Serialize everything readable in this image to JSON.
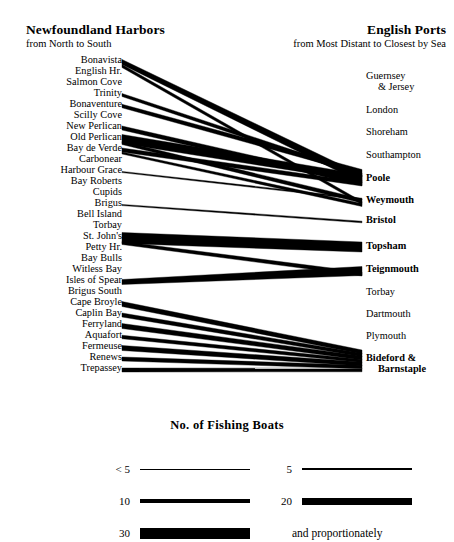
{
  "figure": {
    "left_header": {
      "title": "Newfoundland Harbors",
      "subtitle": "from North to South"
    },
    "right_header": {
      "title": "English Ports",
      "subtitle": "from Most Distant to Closest by Sea"
    }
  },
  "left_labels": [
    {
      "name": "Bonavista",
      "y": 62
    },
    {
      "name": "English Hr.",
      "y": 73
    },
    {
      "name": "Salmon Cove",
      "y": 84
    },
    {
      "name": "Trinity",
      "y": 95
    },
    {
      "name": "Bonaventure",
      "y": 106
    },
    {
      "name": "Scilly Cove",
      "y": 117
    },
    {
      "name": "New Perlican",
      "y": 128
    },
    {
      "name": "Old Perlican",
      "y": 139
    },
    {
      "name": "Bay de Verde",
      "y": 150
    },
    {
      "name": "Carbonear",
      "y": 161
    },
    {
      "name": "Harbour Grace",
      "y": 172
    },
    {
      "name": "Bay Roberts",
      "y": 183
    },
    {
      "name": "Cupids",
      "y": 194
    },
    {
      "name": "Brigus",
      "y": 205
    },
    {
      "name": "Bell Island",
      "y": 216
    },
    {
      "name": "Torbay",
      "y": 227
    },
    {
      "name": "St. John's",
      "y": 238
    },
    {
      "name": "Petty Hr.",
      "y": 249
    },
    {
      "name": "Bay Bulls",
      "y": 260
    },
    {
      "name": "Witless Bay",
      "y": 271
    },
    {
      "name": "Isles of Spear",
      "y": 282
    },
    {
      "name": "Brigus South",
      "y": 293
    },
    {
      "name": "Cape Broyle",
      "y": 304
    },
    {
      "name": "Caplin Bay",
      "y": 315
    },
    {
      "name": "Ferryland",
      "y": 326
    },
    {
      "name": "Aquafort",
      "y": 337
    },
    {
      "name": "Fermeuse",
      "y": 348
    },
    {
      "name": "Renews",
      "y": 359
    },
    {
      "name": "Trepassey",
      "y": 370
    }
  ],
  "right_labels": [
    {
      "name": "Guernsey",
      "line2": "& Jersey",
      "y": 78,
      "bold": false
    },
    {
      "name": "London",
      "line2": "",
      "y": 112,
      "bold": false
    },
    {
      "name": "Shoreham",
      "line2": "",
      "y": 134,
      "bold": false
    },
    {
      "name": "Southampton",
      "line2": "",
      "y": 157,
      "bold": false
    },
    {
      "name": "Poole",
      "line2": "",
      "y": 180,
      "bold": true
    },
    {
      "name": "Weymouth",
      "line2": "",
      "y": 202,
      "bold": true
    },
    {
      "name": "Bristol",
      "line2": "",
      "y": 222,
      "bold": true
    },
    {
      "name": "Topsham",
      "line2": "",
      "y": 248,
      "bold": true
    },
    {
      "name": "Teignmouth",
      "line2": "",
      "y": 271,
      "bold": true
    },
    {
      "name": "Torbay",
      "line2": "",
      "y": 294,
      "bold": false
    },
    {
      "name": "Dartmouth",
      "line2": "",
      "y": 316,
      "bold": false
    },
    {
      "name": "Plymouth",
      "line2": "",
      "y": 338,
      "bold": false
    },
    {
      "name": "Bideford &",
      "line2": "Barnstaple",
      "y": 360,
      "bold": true
    }
  ],
  "legend": {
    "title": "No.  of  Fishing Boats",
    "items": [
      {
        "key": "< 5",
        "thickness": 1,
        "col": 0,
        "row": 0
      },
      {
        "key": "5",
        "thickness": 2,
        "col": 1,
        "row": 0
      },
      {
        "key": "10",
        "thickness": 4,
        "col": 0,
        "row": 1
      },
      {
        "key": "20",
        "thickness": 7,
        "col": 1,
        "row": 1
      },
      {
        "key": "30",
        "thickness": 11,
        "col": 0,
        "row": 2
      }
    ],
    "note": "and proportionately"
  },
  "chart_data": {
    "type": "sankey",
    "source_axis_label": "Newfoundland Harbors, from North to South",
    "target_axis_label": "English Ports, from Most Distant to Closest by Sea",
    "unit": "fishing boats",
    "sources": [
      "Bonavista",
      "English Hr.",
      "Salmon Cove",
      "Trinity",
      "Bonaventure",
      "Scilly Cove",
      "New Perlican",
      "Old Perlican",
      "Bay de Verde",
      "Carbonear",
      "Harbour Grace",
      "Bay Roberts",
      "Cupids",
      "Brigus",
      "Bell Island",
      "Torbay",
      "St. John's",
      "Petty Hr.",
      "Bay Bulls",
      "Witless Bay",
      "Isles of Spear",
      "Brigus South",
      "Cape Broyle",
      "Caplin Bay",
      "Ferryland",
      "Aquafort",
      "Fermeuse",
      "Renews",
      "Trepassey"
    ],
    "targets": [
      "Guernsey & Jersey",
      "London",
      "Shoreham",
      "Southampton",
      "Poole",
      "Weymouth",
      "Bristol",
      "Topsham",
      "Teignmouth",
      "Torbay",
      "Dartmouth",
      "Plymouth",
      "Bideford & Barnstaple"
    ],
    "links": [
      {
        "source": "Bonavista",
        "target": "Poole",
        "value": 22,
        "sx": 122,
        "sy": 62,
        "sw": 5,
        "tx": 362,
        "ty": 179,
        "tw": 8
      },
      {
        "source": "Trinity",
        "target": "Poole",
        "value": 12,
        "sx": 122,
        "sy": 95,
        "sw": 3,
        "tx": 362,
        "ty": 175,
        "tw": 4
      },
      {
        "source": "Bonaventure",
        "target": "Poole",
        "value": 14,
        "sx": 122,
        "sy": 106,
        "sw": 3.5,
        "tx": 362,
        "ty": 172,
        "tw": 5
      },
      {
        "source": "New Perlican",
        "target": "Poole",
        "value": 16,
        "sx": 122,
        "sy": 128,
        "sw": 4,
        "tx": 362,
        "ty": 183,
        "tw": 5
      },
      {
        "source": "Old Perlican",
        "target": "Poole",
        "value": 26,
        "sx": 122,
        "sy": 139,
        "sw": 9,
        "tx": 362,
        "ty": 178,
        "tw": 7
      },
      {
        "source": "Bay de Verde",
        "target": "Poole",
        "value": 15,
        "sx": 122,
        "sy": 150,
        "sw": 4,
        "tx": 362,
        "ty": 184,
        "tw": 4
      },
      {
        "source": "Bonavista",
        "target": "Weymouth",
        "value": 10,
        "sx": 122,
        "sy": 66,
        "sw": 3,
        "tx": 362,
        "ty": 203,
        "tw": 3
      },
      {
        "source": "Old Perlican",
        "target": "Weymouth",
        "value": 12,
        "sx": 122,
        "sy": 143,
        "sw": 3,
        "tx": 362,
        "ty": 201,
        "tw": 4
      },
      {
        "source": "Bay de Verde",
        "target": "Weymouth",
        "value": 8,
        "sx": 122,
        "sy": 153,
        "sw": 2,
        "tx": 362,
        "ty": 205,
        "tw": 3
      },
      {
        "source": "Harbour Grace",
        "target": "Weymouth",
        "value": 4,
        "sx": 122,
        "sy": 172,
        "sw": 1.2,
        "tx": 362,
        "ty": 199,
        "tw": 1.6
      },
      {
        "source": "Brigus",
        "target": "Bristol",
        "value": 4,
        "sx": 122,
        "sy": 205,
        "sw": 1.2,
        "tx": 362,
        "ty": 222,
        "tw": 1.6
      },
      {
        "source": "St. John's",
        "target": "Topsham",
        "value": 30,
        "sx": 122,
        "sy": 238,
        "sw": 11,
        "tx": 362,
        "ty": 247,
        "tw": 10
      },
      {
        "source": "Isles of Spear",
        "target": "Teignmouth",
        "value": 18,
        "sx": 122,
        "sy": 282,
        "sw": 5,
        "tx": 362,
        "ty": 271,
        "tw": 9
      },
      {
        "source": "St. John's",
        "target": "Teignmouth",
        "value": 10,
        "sx": 122,
        "sy": 243,
        "sw": 3,
        "tx": 362,
        "ty": 274,
        "tw": 4
      },
      {
        "source": "Cape Broyle",
        "target": "Bideford & Barnstaple",
        "value": 14,
        "sx": 122,
        "sy": 304,
        "sw": 5,
        "tx": 362,
        "ty": 352,
        "tw": 4
      },
      {
        "source": "Caplin Bay",
        "target": "Bideford & Barnstaple",
        "value": 12,
        "sx": 122,
        "sy": 315,
        "sw": 4,
        "tx": 362,
        "ty": 355,
        "tw": 3.5
      },
      {
        "source": "Ferryland",
        "target": "Bideford & Barnstaple",
        "value": 16,
        "sx": 122,
        "sy": 326,
        "sw": 5,
        "tx": 362,
        "ty": 358,
        "tw": 4
      },
      {
        "source": "Aquafort",
        "target": "Bideford & Barnstaple",
        "value": 10,
        "sx": 122,
        "sy": 337,
        "sw": 3.5,
        "tx": 362,
        "ty": 361,
        "tw": 3
      },
      {
        "source": "Fermeuse",
        "target": "Bideford & Barnstaple",
        "value": 14,
        "sx": 122,
        "sy": 348,
        "sw": 5,
        "tx": 362,
        "ty": 364,
        "tw": 4
      },
      {
        "source": "Renews",
        "target": "Bideford & Barnstaple",
        "value": 12,
        "sx": 122,
        "sy": 359,
        "sw": 4,
        "tx": 362,
        "ty": 367,
        "tw": 3.5
      },
      {
        "source": "Trepassey",
        "target": "Bideford & Barnstaple",
        "value": 12,
        "sx": 122,
        "sy": 370,
        "sw": 4,
        "tx": 362,
        "ty": 370,
        "tw": 3.5
      }
    ]
  }
}
